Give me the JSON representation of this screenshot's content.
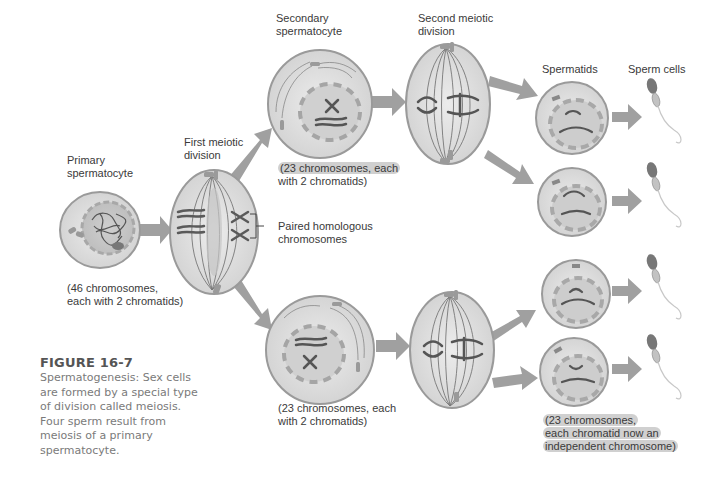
{
  "figure": {
    "title": "FIGURE 16-7",
    "caption": "Spermatogenesis: Sex cells are formed by a special type of division called meiosis. Four sperm result from meiosis of a primary spermatocyte."
  },
  "stages": {
    "primary": {
      "label_line1": "Primary",
      "label_line2": "spermatocyte",
      "note_line1": "(46 chromosomes,",
      "note_line2": "each with 2 chromatids)"
    },
    "first_division": {
      "label_line1": "First meiotic",
      "label_line2": "division",
      "callout_line1": "Paired homologous",
      "callout_line2": "chromosomes"
    },
    "secondary": {
      "label_line1": "Secondary",
      "label_line2": "spermatocyte",
      "note_top_line1": "(23 chromosomes, each",
      "note_top_line2": "with 2 chromatids)",
      "note_bottom_line1": "(23 chromosomes, each",
      "note_bottom_line2": "with 2 chromatids)"
    },
    "second_division": {
      "label_line1": "Second meiotic",
      "label_line2": "division"
    },
    "spermatids": {
      "label": "Spermatids",
      "note_line1": "(23 chromosomes,",
      "note_line2": "each chromatid now an",
      "note_line3": "independent chromosome)"
    },
    "sperm": {
      "label": "Sperm cells"
    }
  },
  "colors": {
    "cell_fill": "#dcdcdc",
    "cell_stroke": "#9a9a9a",
    "nucleus_fill": "#c6c6c6",
    "arrow": "#9e9e9e",
    "chromosome": "#5a5a5a",
    "text": "#3a3a3a",
    "caption_title": "#555555",
    "caption_body": "#7a7a7a"
  }
}
